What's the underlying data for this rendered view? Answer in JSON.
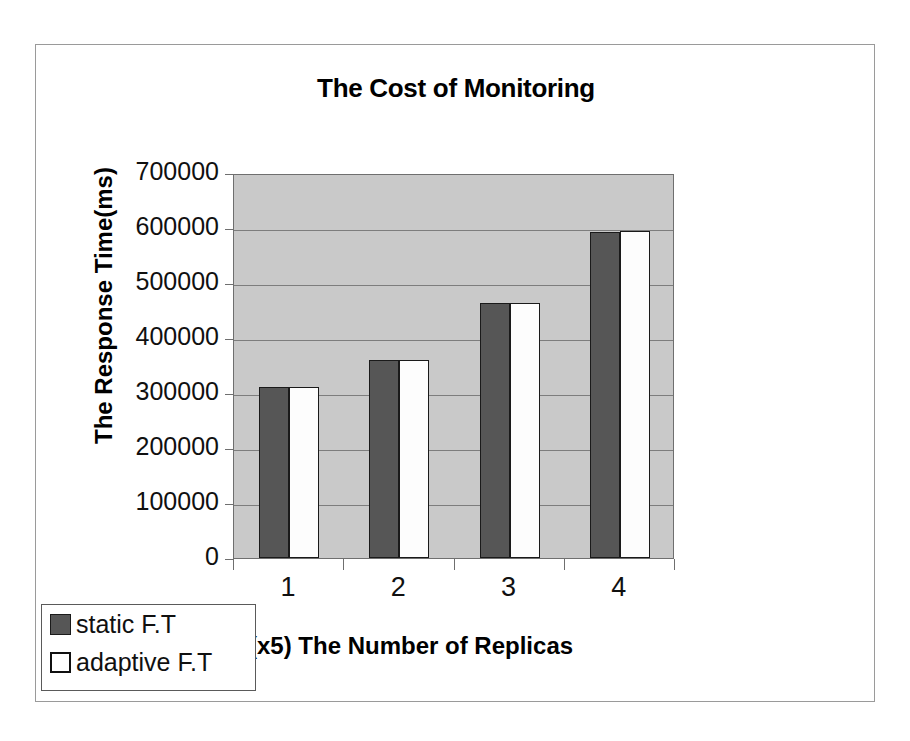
{
  "chart_data": {
    "type": "bar",
    "title": "The Cost of Monitoring",
    "xlabel": "(x5) The Number of Replicas",
    "ylabel": "The Response Time(ms)",
    "categories": [
      "1",
      "2",
      "3",
      "4"
    ],
    "series": [
      {
        "name": "static F.T",
        "color": "#565656",
        "values": [
          311000,
          360000,
          464000,
          593000
        ]
      },
      {
        "name": "adaptive F.T",
        "color": "#ffffff",
        "values": [
          311000,
          360000,
          464000,
          595000
        ]
      }
    ],
    "ylim": [
      0,
      700000
    ],
    "ytick_labels": [
      "700000",
      "600000",
      "500000",
      "400000",
      "300000",
      "200000",
      "100000",
      "0"
    ],
    "ytick_values": [
      700000,
      600000,
      500000,
      400000,
      300000,
      200000,
      100000,
      0
    ],
    "ytick_step": 100000,
    "grid": true,
    "legend_position": "bottom-left",
    "plot_background": "#c9c9c9",
    "frame_color": "#9a9a9a"
  }
}
